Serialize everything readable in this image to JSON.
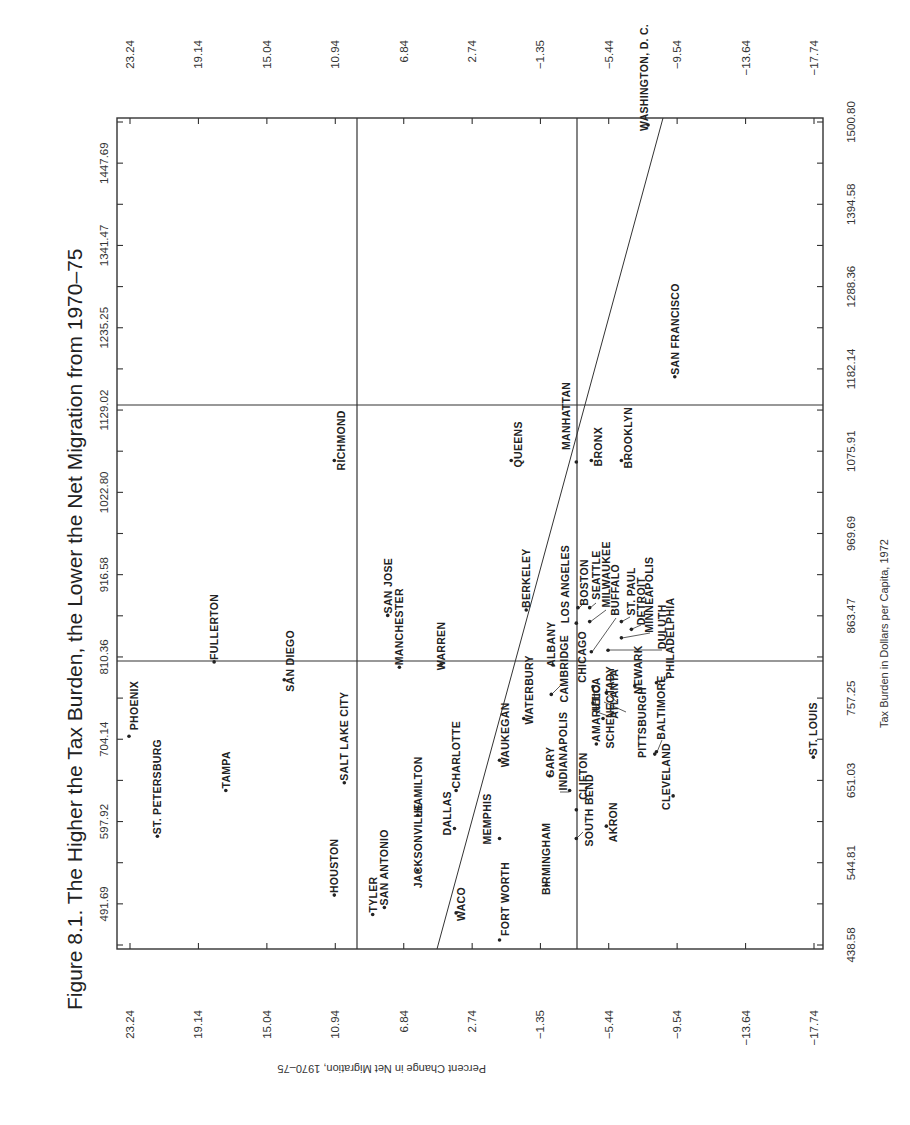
{
  "figure": {
    "title": "Figure 8.1.  The Higher the Tax Burden, the Lower the Net Migration from 1970–75",
    "x_axis_title": "Tax Burden in Dollars per Capita, 1972",
    "y_axis_title": "Percent Change in Net Migration, 1970–75"
  },
  "chart_data": {
    "type": "scatter",
    "title": "Figure 8.1.  The Higher the Tax Burden, the Lower the Net Migration from 1970–75",
    "xlabel": "Tax Burden in Dollars per Capita, 1972",
    "ylabel": "Percent Change in Net Migration, 1970–75",
    "orientation_note": "Figure printed rotated 90 degrees on the page",
    "xlim": [
      438.58,
      1500.8
    ],
    "ylim": [
      -17.74,
      23.24
    ],
    "x_ticks_primary": [
      "438.58",
      "544.81",
      "651.03",
      "757.25",
      "863.47",
      "969.69",
      "1075.91",
      "1182.14",
      "1288.36",
      "1394.58",
      "1500.80"
    ],
    "x_ticks_secondary": [
      "491.69",
      "597.92",
      "704.14",
      "810.36",
      "916.58",
      "1022.80",
      "1129.02",
      "1235.25",
      "1341.47",
      "1447.69"
    ],
    "y_ticks": [
      "23.24",
      "19.14",
      "15.04",
      "10.94",
      "6.84",
      "2.74",
      "−1.35",
      "−5.44",
      "−9.54",
      "−13.64",
      "−17.74"
    ],
    "reference_lines": {
      "tax_burden": [
        810.36,
        1129.02
      ],
      "net_migration": [
        9.65,
        -3.53
      ]
    },
    "regression_line": {
      "from": {
        "tax": 438.58,
        "migration": 3.1
      },
      "to": {
        "tax": 1500.8,
        "migration": -8.3
      }
    },
    "grid": false,
    "points": [
      {
        "city": "PHOENIX",
        "tax": 708,
        "migration": 23.3
      },
      {
        "city": "ST. PETERSBURG",
        "tax": 579,
        "migration": 21.6
      },
      {
        "city": "TAMPA",
        "tax": 638,
        "migration": 17.5
      },
      {
        "city": "FULLERTON",
        "tax": 804,
        "migration": 18.2
      },
      {
        "city": "SAN DIEGO",
        "tax": 781,
        "migration": 14.0
      },
      {
        "city": "SALT LAKE CITY",
        "tax": 648,
        "migration": 10.4
      },
      {
        "city": "HOUSTON",
        "tax": 503,
        "migration": 11.0
      },
      {
        "city": "RICHMOND",
        "tax": 1064,
        "migration": 11.0
      },
      {
        "city": "SAN JOSE",
        "tax": 864,
        "migration": 7.8
      },
      {
        "city": "TYLER",
        "tax": 478,
        "migration": 8.7
      },
      {
        "city": "SAN ANTONIO",
        "tax": 487,
        "migration": 8.0
      },
      {
        "city": "MANCHESTER",
        "tax": 797,
        "migration": 7.1
      },
      {
        "city": "HAMILTON",
        "tax": 606,
        "migration": 6.0
      },
      {
        "city": "WARREN",
        "tax": 801,
        "migration": 4.6
      },
      {
        "city": "CHARLOTTE",
        "tax": 638,
        "migration": 3.7
      },
      {
        "city": "JACKSONVILLE",
        "tax": 535,
        "migration": 6.0
      },
      {
        "city": "DALLAS",
        "tax": 589,
        "migration": 3.8
      },
      {
        "city": "WACO",
        "tax": 480,
        "migration": 3.7
      },
      {
        "city": "MEMPHIS",
        "tax": 576,
        "migration": 1.1
      },
      {
        "city": "FORT WORTH",
        "tax": 445,
        "migration": 1.1
      },
      {
        "city": "WAUKEGAN",
        "tax": 677,
        "migration": 1.1
      },
      {
        "city": "WATERBURY",
        "tax": 731,
        "migration": -0.35
      },
      {
        "city": "BERKELEY",
        "tax": 871,
        "migration": -0.5
      },
      {
        "city": "QUEENS",
        "tax": 1064,
        "migration": 0.4
      },
      {
        "city": "BIRMINGHAM",
        "tax": 516,
        "migration": -1.7
      },
      {
        "city": "GARY",
        "tax": 657,
        "migration": -1.9
      },
      {
        "city": "CAMBRIDGE",
        "tax": 762,
        "migration": -2.0
      },
      {
        "city": "ALBANY",
        "tax": 800,
        "migration": -2.1
      },
      {
        "city": "INDIANAPOLIS",
        "tax": 638,
        "migration": -3.1
      },
      {
        "city": "SOUTH BEND",
        "tax": 576,
        "migration": -3.5
      },
      {
        "city": "CLIFTON",
        "tax": 613,
        "migration": -3.5
      },
      {
        "city": "MANHATTAN",
        "tax": 1062,
        "migration": -3.5
      },
      {
        "city": "BRONX",
        "tax": 1064,
        "migration": -4.4
      },
      {
        "city": "BROOKLYN",
        "tax": 1064,
        "migration": -6.2
      },
      {
        "city": "SAN FRANCISCO",
        "tax": 1172,
        "migration": -9.4
      },
      {
        "city": "WASHINGTON, D. C.",
        "tax": 1497,
        "migration": -7.8
      },
      {
        "city": "ST. LOUIS",
        "tax": 681,
        "migration": -17.7
      },
      {
        "city": "BOSTON",
        "tax": 874,
        "migration": -3.6
      },
      {
        "city": "LOS ANGELES",
        "tax": 854,
        "migration": -3.5
      },
      {
        "city": "SEATTLE",
        "tax": 874,
        "migration": -4.3
      },
      {
        "city": "MILWAUKEE",
        "tax": 856,
        "migration": -4.3
      },
      {
        "city": "BUFFALO",
        "tax": 817,
        "migration": -4.4
      },
      {
        "city": "ST. PAUL",
        "tax": 856,
        "migration": -6.2
      },
      {
        "city": "DETROIT",
        "tax": 846,
        "migration": -6.8
      },
      {
        "city": "MINNEAPOLIS",
        "tax": 835,
        "migration": -6.2
      },
      {
        "city": "DULUTH",
        "tax": 819,
        "migration": -5.4
      },
      {
        "city": "CHICAGO",
        "tax": 772,
        "migration": -4.5
      },
      {
        "city": "AMARILLO",
        "tax": 698,
        "migration": -4.7
      },
      {
        "city": "UTICA",
        "tax": 751,
        "migration": -4.5
      },
      {
        "city": "AKRON",
        "tax": 592,
        "migration": -5.3
      },
      {
        "city": "SCHENECTADY",
        "tax": 731,
        "migration": -5.1
      },
      {
        "city": "ATLANTA",
        "tax": 764,
        "migration": -5.3
      },
      {
        "city": "NEWARK",
        "tax": 773,
        "migration": -7.0
      },
      {
        "city": "PITTSBURGH",
        "tax": 685,
        "migration": -8.2
      },
      {
        "city": "BALTIMORE",
        "tax": 688,
        "migration": -8.3
      },
      {
        "city": "CLEVELAND",
        "tax": 631,
        "migration": -9.3
      },
      {
        "city": "PHILADELPHIA",
        "tax": 777,
        "migration": -8.3
      }
    ]
  }
}
